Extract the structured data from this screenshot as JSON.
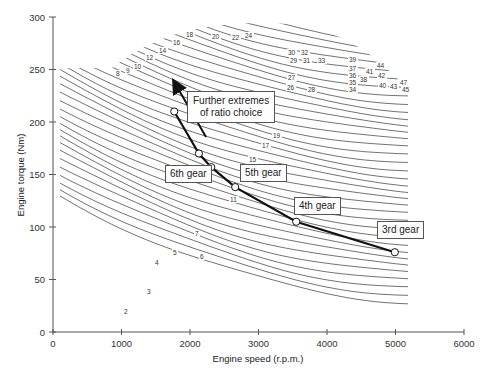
{
  "chart_data": {
    "type": "line",
    "title": "",
    "xlabel": "Engine speed (r.p.m.)",
    "ylabel": "Engine torque (Nm)",
    "xlim": [
      0,
      6000
    ],
    "ylim": [
      0,
      300
    ],
    "x_ticks": [
      "0",
      "1000",
      "2000",
      "3000",
      "4000",
      "5000",
      "6000"
    ],
    "y_ticks": [
      "0",
      "50",
      "100",
      "150",
      "200",
      "250",
      "300"
    ],
    "grid": false,
    "legend": null,
    "series": [
      {
        "name": "Operating points by gear",
        "points": [
          {
            "label": "Further extreme",
            "rpm": 1770,
            "torque": 210
          },
          {
            "label": "6th gear (upper)",
            "rpm": 2130,
            "torque": 170
          },
          {
            "label": "6th gear",
            "rpm": 2310,
            "torque": 157
          },
          {
            "label": "5th gear",
            "rpm": 2660,
            "torque": 138
          },
          {
            "label": "4th gear",
            "rpm": 3550,
            "torque": 105
          },
          {
            "label": "3rd gear",
            "rpm": 4990,
            "torque": 76
          }
        ]
      }
    ],
    "contour_labels": [
      "2",
      "3",
      "4",
      "5",
      "6",
      "7",
      "8",
      "9",
      "10",
      "11",
      "12",
      "14",
      "15",
      "16",
      "17",
      "18",
      "19",
      "20",
      "22",
      "24",
      "26",
      "27",
      "28",
      "29",
      "30",
      "31",
      "32",
      "33",
      "34",
      "35",
      "36",
      "37",
      "38",
      "39",
      "40",
      "41",
      "42",
      "43",
      "44",
      "45",
      "47"
    ],
    "annotations": [
      {
        "text": "Further extremes of ratio choice",
        "type": "arrow",
        "direction": "up-left along line"
      },
      {
        "text": "6th gear"
      },
      {
        "text": "5th gear"
      },
      {
        "text": "4th gear"
      },
      {
        "text": "3rd gear"
      }
    ]
  },
  "labels": {
    "xlabel": "Engine speed (r.p.m.)",
    "ylabel": "Engine torque (Nm)",
    "note_line1": "Further extremes",
    "note_line2": "of ratio choice",
    "gear6": "6th gear",
    "gear5": "5th gear",
    "gear4": "4th gear",
    "gear3": "3rd gear"
  },
  "contour_label_positions": [
    {
      "t": "2",
      "x": 124,
      "y": 314
    },
    {
      "t": "3",
      "x": 147,
      "y": 294
    },
    {
      "t": "4",
      "x": 155,
      "y": 265
    },
    {
      "t": "5",
      "x": 173,
      "y": 255
    },
    {
      "t": "6",
      "x": 200,
      "y": 259
    },
    {
      "t": "7",
      "x": 195,
      "y": 236
    },
    {
      "t": "8",
      "x": 116,
      "y": 76
    },
    {
      "t": "9",
      "x": 126,
      "y": 73
    },
    {
      "t": "10",
      "x": 134,
      "y": 69
    },
    {
      "t": "12",
      "x": 146,
      "y": 60
    },
    {
      "t": "14",
      "x": 159,
      "y": 53
    },
    {
      "t": "16",
      "x": 173,
      "y": 45
    },
    {
      "t": "18",
      "x": 186,
      "y": 37
    },
    {
      "t": "20",
      "x": 212,
      "y": 39
    },
    {
      "t": "22",
      "x": 232,
      "y": 40
    },
    {
      "t": "24",
      "x": 245,
      "y": 38
    },
    {
      "t": "11",
      "x": 230,
      "y": 202
    },
    {
      "t": "15",
      "x": 249,
      "y": 162
    },
    {
      "t": "17",
      "x": 262,
      "y": 148
    },
    {
      "t": "19",
      "x": 273,
      "y": 138
    },
    {
      "t": "30",
      "x": 288,
      "y": 55
    },
    {
      "t": "32",
      "x": 301,
      "y": 55
    },
    {
      "t": "29",
      "x": 290,
      "y": 63
    },
    {
      "t": "31",
      "x": 303,
      "y": 63
    },
    {
      "t": "33",
      "x": 318,
      "y": 63
    },
    {
      "t": "27",
      "x": 288,
      "y": 80
    },
    {
      "t": "26",
      "x": 287,
      "y": 90
    },
    {
      "t": "28",
      "x": 308,
      "y": 92
    },
    {
      "t": "39",
      "x": 349,
      "y": 62
    },
    {
      "t": "37",
      "x": 349,
      "y": 71
    },
    {
      "t": "36",
      "x": 349,
      "y": 78
    },
    {
      "t": "35",
      "x": 349,
      "y": 85
    },
    {
      "t": "34",
      "x": 349,
      "y": 92
    },
    {
      "t": "38",
      "x": 360,
      "y": 82
    },
    {
      "t": "41",
      "x": 366,
      "y": 74
    },
    {
      "t": "44",
      "x": 377,
      "y": 68
    },
    {
      "t": "42",
      "x": 378,
      "y": 78
    },
    {
      "t": "40",
      "x": 379,
      "y": 88
    },
    {
      "t": "43",
      "x": 390,
      "y": 89
    },
    {
      "t": "47",
      "x": 400,
      "y": 85
    },
    {
      "t": "45",
      "x": 402,
      "y": 92
    }
  ]
}
